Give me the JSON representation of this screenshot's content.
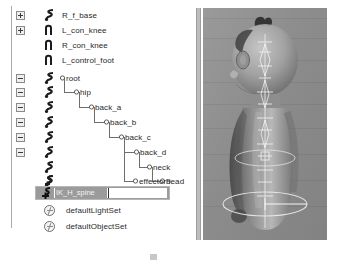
{
  "app": {
    "panel_title": "Outliner",
    "viewport_title": "Perspective View"
  },
  "outliner": {
    "rows": [
      {
        "label": "R_f_base",
        "toggle": "plus",
        "icon": "joint-chain-icon",
        "indent": 0,
        "connector": "none"
      },
      {
        "label": "L_con_knee",
        "toggle": "plus",
        "icon": "joint-curve-icon",
        "indent": 0,
        "connector": "none"
      },
      {
        "label": "R_con_knee",
        "toggle": "none",
        "icon": "joint-curve-icon",
        "indent": 0,
        "connector": "none"
      },
      {
        "label": "L_control_foot",
        "toggle": "none",
        "icon": "joint-curve-icon",
        "indent": 0,
        "connector": "none"
      },
      {
        "label": "root",
        "toggle": "minus",
        "icon": "joint-chain-icon",
        "indent": 0,
        "connector": "node"
      },
      {
        "label": "hip",
        "toggle": "minus",
        "icon": "joint-chain-icon",
        "indent": 1,
        "connector": "elbow"
      },
      {
        "label": "back_a",
        "toggle": "minus",
        "icon": "joint-chain-icon",
        "indent": 2,
        "connector": "elbow"
      },
      {
        "label": "back_b",
        "toggle": "minus",
        "icon": "joint-chain-icon",
        "indent": 3,
        "connector": "elbow"
      },
      {
        "label": "back_c",
        "toggle": "minus",
        "icon": "joint-chain-icon",
        "indent": 4,
        "connector": "elbow"
      },
      {
        "label": "back_d",
        "toggle": "minus",
        "icon": "joint-chain-icon",
        "indent": 5,
        "connector": "elbow"
      },
      {
        "label": "neck",
        "toggle": "minus",
        "icon": "joint-chain-icon",
        "indent": 6,
        "connector": "elbow"
      },
      {
        "label": "head",
        "toggle": "none",
        "icon": "joint-chain-icon",
        "indent": 7,
        "connector": "elbow"
      },
      {
        "label": "effector9",
        "toggle": "none",
        "icon": "ik-effector-icon",
        "indent": 6,
        "connector": "elbow"
      }
    ],
    "selected_row": {
      "name": "IK_H_spine",
      "icon": "ik-handle-icon",
      "editing": true,
      "highlight_color": "#9a9a9a"
    },
    "set_rows": [
      {
        "label": "defaultLightSet",
        "icon": "set-node-icon"
      },
      {
        "label": "defaultObjectSet",
        "icon": "set-node-icon"
      }
    ]
  },
  "viewport": {
    "shading": "grayscale-xray",
    "background_color": "#8e8e8e",
    "character": "stylized-child-figure",
    "overlays": [
      "spine-joint-chain",
      "ik-handle-control-ring",
      "root-control-ring"
    ]
  },
  "caption": {
    "text": ""
  }
}
